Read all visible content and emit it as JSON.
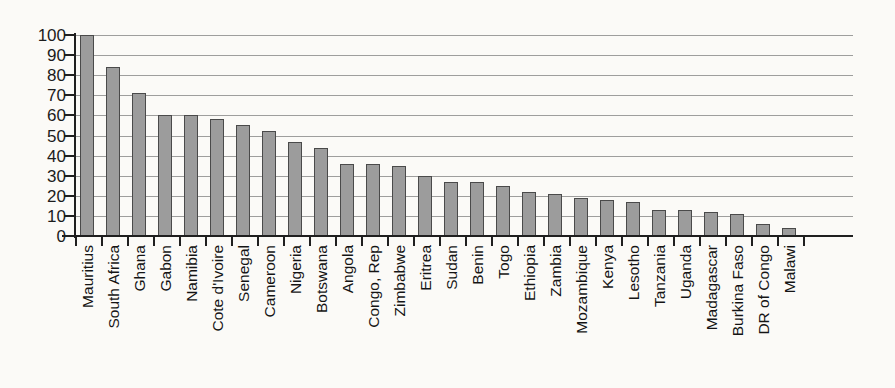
{
  "chart_data": {
    "type": "bar",
    "title": "",
    "subtitle": "",
    "xlabel": "",
    "ylabel": "",
    "ylim": [
      0,
      100
    ],
    "ytick_step": 10,
    "yticks": [
      100,
      90,
      80,
      70,
      60,
      50,
      40,
      30,
      20,
      10,
      0
    ],
    "grid": true,
    "grid_axis": "y",
    "legend": false,
    "legend_position": "none",
    "bar_color": "#9c9c9c",
    "bar_edge_color": "#4a4a4a",
    "categories": [
      "Mauritius",
      "South Africa",
      "Ghana",
      "Gabon",
      "Namibia",
      "Cote d'Ivoire",
      "Senegal",
      "Cameroon",
      "Nigeria",
      "Botswana",
      "Angola",
      "Congo, Rep",
      "Zimbabwe",
      "Eritrea",
      "Sudan",
      "Benin",
      "Togo",
      "Ethiopia",
      "Zambia",
      "Mozambique",
      "Kenya",
      "Lesotho",
      "Tanzania",
      "Uganda",
      "Madagascar",
      "Burkina Faso",
      "DR of Congo",
      "Malawi"
    ],
    "values": [
      100,
      84,
      71,
      60,
      60,
      58,
      55,
      52,
      47,
      44,
      36,
      36,
      35,
      30,
      27,
      27,
      25,
      22,
      21,
      19,
      18,
      17,
      13,
      13,
      12,
      11,
      6,
      4
    ]
  },
  "bleed_through": [
    {
      "text": "",
      "x": 0,
      "y": 0
    }
  ]
}
